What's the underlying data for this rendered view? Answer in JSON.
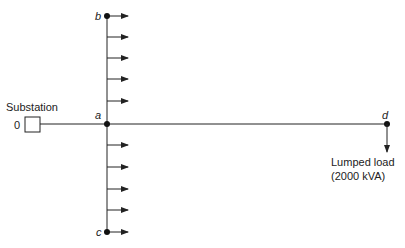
{
  "diagram": {
    "title": "",
    "substation": {
      "label": "Substation",
      "node_label": "0"
    },
    "nodes": {
      "a": {
        "label": "a"
      },
      "b": {
        "label": "b"
      },
      "c": {
        "label": "c"
      },
      "d": {
        "label": "d"
      }
    },
    "lumped_load": {
      "line1": "Lumped load",
      "line2": "(2000 kVA)"
    },
    "lateral_upper_loads": 6,
    "lateral_lower_loads": 6,
    "colors": {
      "line": "#222222",
      "background": "#ffffff"
    }
  }
}
